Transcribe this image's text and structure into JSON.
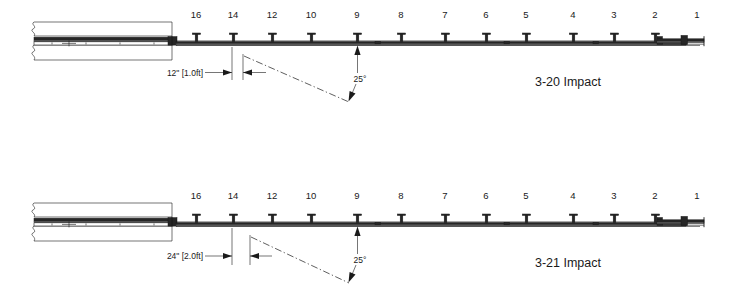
{
  "drawing": {
    "type": "engineering-plan-view",
    "description": "Guardrail impact test layout, plan view",
    "diagram_count": 2
  },
  "diagrams": [
    {
      "id": "3-20",
      "title": "3-20 Impact",
      "offset_dimension": "12\" [1.0ft]",
      "offset_inches": 12,
      "offset_feet": 1.0,
      "impact_angle": "25°",
      "impact_angle_degrees": 25,
      "post_labels": [
        "16",
        "14",
        "12",
        "10",
        "9",
        "8",
        "7",
        "6",
        "5",
        "4",
        "3",
        "2",
        "1"
      ],
      "impact_post": "9",
      "barrier": {
        "type": "concrete-barrier",
        "break_marks": true,
        "position": "left"
      },
      "terminal": {
        "type": "end-terminal-anchor",
        "position": "right"
      }
    },
    {
      "id": "3-21",
      "title": "3-21 Impact",
      "offset_dimension": "24\" [2.0ft]",
      "offset_inches": 24,
      "offset_feet": 2.0,
      "impact_angle": "25°",
      "impact_angle_degrees": 25,
      "post_labels": [
        "16",
        "14",
        "12",
        "10",
        "9",
        "8",
        "7",
        "6",
        "5",
        "4",
        "3",
        "2",
        "1"
      ],
      "impact_post": "9",
      "barrier": {
        "type": "concrete-barrier",
        "break_marks": true,
        "position": "left"
      },
      "terminal": {
        "type": "end-terminal-anchor",
        "position": "right"
      }
    }
  ],
  "colors": {
    "line": "#1a1a1a",
    "rail_dark": "#262626",
    "rail_mid": "#5c5c5c",
    "background": "#ffffff"
  }
}
